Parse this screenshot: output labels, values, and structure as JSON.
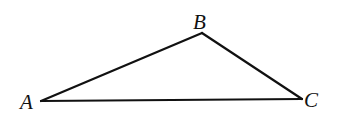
{
  "diagram": {
    "type": "triangle",
    "stroke_color": "#111111",
    "background": "#ffffff",
    "vertices": [
      {
        "label": "A",
        "x": 41,
        "y": 101,
        "label_x": 20,
        "label_y": 109
      },
      {
        "label": "B",
        "x": 202,
        "y": 33,
        "label_x": 193,
        "label_y": 29
      },
      {
        "label": "C",
        "x": 302,
        "y": 99,
        "label_x": 304,
        "label_y": 107
      }
    ],
    "edges": [
      {
        "from": "A",
        "to": "B"
      },
      {
        "from": "B",
        "to": "C"
      },
      {
        "from": "C",
        "to": "A"
      }
    ]
  }
}
